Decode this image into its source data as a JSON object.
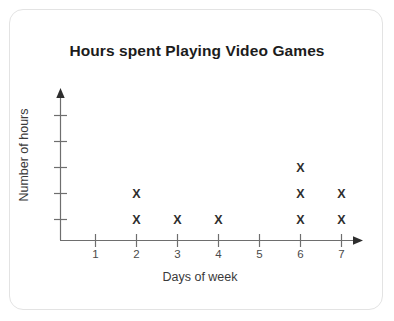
{
  "card": {
    "border_color": "#e3e3e3",
    "background": "#ffffff"
  },
  "chart_data": {
    "type": "scatter",
    "title": "Hours spent Playing Video Games",
    "xlabel": "Days of week",
    "ylabel": "Number of hours",
    "categories": [
      "1",
      "2",
      "3",
      "4",
      "5",
      "6",
      "7"
    ],
    "values": [
      0,
      2,
      1,
      1,
      0,
      3,
      2
    ],
    "marker": "X",
    "marker_color": "#2e2e2e",
    "axis_color": "#6e6e6e",
    "x_tick_labels": [
      "1",
      "2",
      "3",
      "4",
      "5",
      "6",
      "7"
    ],
    "y_tick_labels": [
      "",
      "",
      "",
      "",
      ""
    ],
    "y_tick_count": 5,
    "xlim": [
      0,
      7.6
    ],
    "ylim": [
      0,
      5
    ],
    "grid": false,
    "legend": false,
    "axis_arrows": true,
    "note": "Dot plot: each X mark represents one unit of hours stacked above the day number."
  }
}
